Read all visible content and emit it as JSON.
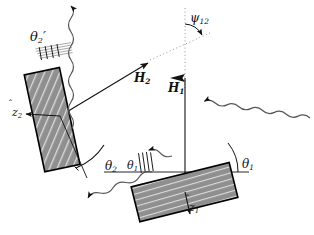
{
  "figure": {
    "background_color": "#ffffff",
    "line_color": "#111111",
    "slab_fill": "#8c8c8c",
    "slab_hatch_color": "#d9d9d9",
    "slab_border": "#000000",
    "dotted_color": "#8a8a8a"
  },
  "labels": {
    "theta_2_prime": {
      "base": "θ",
      "sub": "2",
      "prime": "′",
      "x": 30,
      "y": 30
    },
    "theta_2": {
      "base": "θ",
      "sub": "2",
      "x": 105,
      "y": 160
    },
    "theta_1_inner": {
      "base": "θ",
      "sub": "1",
      "x": 127,
      "y": 160
    },
    "theta_1_right": {
      "base": "θ",
      "sub": "1",
      "x": 242,
      "y": 158
    },
    "psi_12": {
      "base": "ψ",
      "sub": "12",
      "x": 190,
      "y": 12
    },
    "H_2": {
      "base": "H",
      "sub": "2",
      "x": 134,
      "y": 72
    },
    "H_1": {
      "base": "H",
      "sub": "1",
      "x": 168,
      "y": 82
    },
    "z_hat_2": {
      "base": "z",
      "sub": "2",
      "hat": "̂",
      "x": 12,
      "y": 107
    },
    "z_hat_1": {
      "base": "z",
      "sub": "1",
      "hat": "̂",
      "x": 189,
      "y": 202
    }
  },
  "elements": {
    "slab_2_name": "upper-left-slab",
    "slab_1_name": "lower-right-slab",
    "vector_H2_name": "H2-field-arrow",
    "vector_H1_name": "H1-field-arrow",
    "zhat2_name": "z-hat-2-axis-arrow",
    "zhat1_name": "z-hat-1-axis-arrow",
    "wave_out_top_name": "outgoing-wave-top",
    "wave_out_left_name": "scattered-wave-left",
    "wave_in_right_name": "incident-wave-right",
    "arc_theta2_name": "theta-2-arc",
    "arc_theta1_name": "theta-1-arc",
    "arc_psi12_name": "psi-12-arc",
    "baseline_name": "horizontal-baseline",
    "dotted_vertical_name": "dotted-vertical-reference",
    "dotted_slant_name": "dotted-slant-reference"
  }
}
